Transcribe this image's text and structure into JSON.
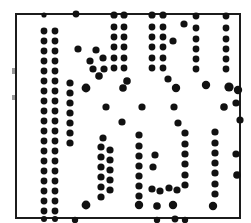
{
  "figure": {
    "kind": "dot-matrix-plate",
    "width": 251,
    "height": 223,
    "background_color": "#ffffff",
    "dot_color": "#111111",
    "frame": {
      "color": "#1c1c1c",
      "thickness": 2,
      "x": 15,
      "y": 13,
      "width": 226,
      "height": 206
    },
    "grid": {
      "origin_x": 42,
      "origin_y": 22,
      "step_x": 10.1,
      "step_y": 10.3,
      "columns": 20,
      "rows": 19
    },
    "dot_radius_small": 3.1,
    "dot_radius_large": 4.4
  },
  "chart_data": {
    "type": "scatter",
    "xlabel": "",
    "ylabel": "",
    "xlim": [
      15,
      241
    ],
    "ylim": [
      13,
      219
    ],
    "grid": false,
    "legend": "none",
    "note": "Monochrome printed dot plate; each point is an ink dot. r = dot radius in px.",
    "points": [
      {
        "x": 44,
        "y": 15,
        "r": 2.6
      },
      {
        "x": 76,
        "y": 14,
        "r": 3.4
      },
      {
        "x": 114,
        "y": 15,
        "r": 3.6
      },
      {
        "x": 124,
        "y": 15,
        "r": 3.6
      },
      {
        "x": 152,
        "y": 15,
        "r": 3.6
      },
      {
        "x": 163,
        "y": 15,
        "r": 3.6
      },
      {
        "x": 196,
        "y": 16,
        "r": 3.4
      },
      {
        "x": 226,
        "y": 16,
        "r": 3.4
      },
      {
        "x": 44,
        "y": 31,
        "r": 3.4
      },
      {
        "x": 55,
        "y": 31,
        "r": 3.4
      },
      {
        "x": 114,
        "y": 27,
        "r": 3.4
      },
      {
        "x": 124,
        "y": 27,
        "r": 3.4
      },
      {
        "x": 152,
        "y": 27,
        "r": 3.4
      },
      {
        "x": 163,
        "y": 27,
        "r": 3.4
      },
      {
        "x": 184,
        "y": 24,
        "r": 3.6
      },
      {
        "x": 196,
        "y": 28,
        "r": 3.4
      },
      {
        "x": 226,
        "y": 28,
        "r": 3.4
      },
      {
        "x": 44,
        "y": 41,
        "r": 3.4
      },
      {
        "x": 55,
        "y": 41,
        "r": 3.4
      },
      {
        "x": 114,
        "y": 37,
        "r": 3.4
      },
      {
        "x": 124,
        "y": 37,
        "r": 3.4
      },
      {
        "x": 152,
        "y": 37,
        "r": 3.4
      },
      {
        "x": 163,
        "y": 37,
        "r": 3.4
      },
      {
        "x": 173,
        "y": 41,
        "r": 3.6
      },
      {
        "x": 196,
        "y": 39,
        "r": 3.4
      },
      {
        "x": 226,
        "y": 39,
        "r": 3.4
      },
      {
        "x": 44,
        "y": 51,
        "r": 3.4
      },
      {
        "x": 55,
        "y": 51,
        "r": 3.4
      },
      {
        "x": 78,
        "y": 49,
        "r": 3.6
      },
      {
        "x": 96,
        "y": 50,
        "r": 3.6
      },
      {
        "x": 114,
        "y": 47,
        "r": 3.4
      },
      {
        "x": 124,
        "y": 47,
        "r": 3.4
      },
      {
        "x": 152,
        "y": 47,
        "r": 3.4
      },
      {
        "x": 163,
        "y": 47,
        "r": 3.4
      },
      {
        "x": 196,
        "y": 49,
        "r": 3.4
      },
      {
        "x": 226,
        "y": 49,
        "r": 3.4
      },
      {
        "x": 44,
        "y": 61,
        "r": 3.4
      },
      {
        "x": 55,
        "y": 61,
        "r": 3.4
      },
      {
        "x": 90,
        "y": 61,
        "r": 3.6
      },
      {
        "x": 103,
        "y": 58,
        "r": 3.6
      },
      {
        "x": 114,
        "y": 58,
        "r": 3.4
      },
      {
        "x": 124,
        "y": 58,
        "r": 3.4
      },
      {
        "x": 152,
        "y": 58,
        "r": 3.4
      },
      {
        "x": 163,
        "y": 58,
        "r": 3.4
      },
      {
        "x": 196,
        "y": 59,
        "r": 3.4
      },
      {
        "x": 226,
        "y": 59,
        "r": 3.4
      },
      {
        "x": 44,
        "y": 71,
        "r": 3.4
      },
      {
        "x": 55,
        "y": 71,
        "r": 3.4
      },
      {
        "x": 93,
        "y": 69,
        "r": 3.6
      },
      {
        "x": 104,
        "y": 69,
        "r": 3.6
      },
      {
        "x": 114,
        "y": 68,
        "r": 3.4
      },
      {
        "x": 124,
        "y": 68,
        "r": 3.4
      },
      {
        "x": 152,
        "y": 68,
        "r": 3.4
      },
      {
        "x": 163,
        "y": 68,
        "r": 3.4
      },
      {
        "x": 196,
        "y": 69,
        "r": 3.4
      },
      {
        "x": 226,
        "y": 69,
        "r": 3.4
      },
      {
        "x": 44,
        "y": 81,
        "r": 3.4
      },
      {
        "x": 55,
        "y": 81,
        "r": 3.4
      },
      {
        "x": 70,
        "y": 83,
        "r": 3.6
      },
      {
        "x": 99,
        "y": 76,
        "r": 3.8
      },
      {
        "x": 127,
        "y": 81,
        "r": 3.8
      },
      {
        "x": 168,
        "y": 79,
        "r": 3.6
      },
      {
        "x": 44,
        "y": 91,
        "r": 3.4
      },
      {
        "x": 55,
        "y": 91,
        "r": 3.4
      },
      {
        "x": 70,
        "y": 93,
        "r": 3.6
      },
      {
        "x": 86,
        "y": 88,
        "r": 4.4
      },
      {
        "x": 123,
        "y": 88,
        "r": 3.8
      },
      {
        "x": 176,
        "y": 88,
        "r": 4.2
      },
      {
        "x": 206,
        "y": 85,
        "r": 4.2
      },
      {
        "x": 229,
        "y": 87,
        "r": 4.6
      },
      {
        "x": 238,
        "y": 90,
        "r": 4.2
      },
      {
        "x": 44,
        "y": 101,
        "r": 3.4
      },
      {
        "x": 55,
        "y": 101,
        "r": 3.4
      },
      {
        "x": 70,
        "y": 103,
        "r": 3.6
      },
      {
        "x": 236,
        "y": 103,
        "r": 3.6
      },
      {
        "x": 44,
        "y": 111,
        "r": 3.4
      },
      {
        "x": 55,
        "y": 111,
        "r": 3.4
      },
      {
        "x": 70,
        "y": 113,
        "r": 3.6
      },
      {
        "x": 106,
        "y": 107,
        "r": 3.6
      },
      {
        "x": 142,
        "y": 107,
        "r": 3.6
      },
      {
        "x": 174,
        "y": 107,
        "r": 3.6
      },
      {
        "x": 224,
        "y": 107,
        "r": 3.8
      },
      {
        "x": 44,
        "y": 121,
        "r": 3.4
      },
      {
        "x": 55,
        "y": 121,
        "r": 3.4
      },
      {
        "x": 70,
        "y": 123,
        "r": 3.6
      },
      {
        "x": 122,
        "y": 122,
        "r": 3.6
      },
      {
        "x": 178,
        "y": 123,
        "r": 3.6
      },
      {
        "x": 240,
        "y": 120,
        "r": 3.6
      },
      {
        "x": 44,
        "y": 131,
        "r": 3.4
      },
      {
        "x": 55,
        "y": 131,
        "r": 3.4
      },
      {
        "x": 70,
        "y": 133,
        "r": 3.6
      },
      {
        "x": 44,
        "y": 141,
        "r": 3.4
      },
      {
        "x": 55,
        "y": 141,
        "r": 3.4
      },
      {
        "x": 70,
        "y": 143,
        "r": 3.6
      },
      {
        "x": 103,
        "y": 138,
        "r": 3.6
      },
      {
        "x": 139,
        "y": 135,
        "r": 3.6
      },
      {
        "x": 185,
        "y": 133,
        "r": 3.6
      },
      {
        "x": 215,
        "y": 132,
        "r": 3.6
      },
      {
        "x": 44,
        "y": 151,
        "r": 3.4
      },
      {
        "x": 55,
        "y": 151,
        "r": 3.4
      },
      {
        "x": 101,
        "y": 147,
        "r": 3.6
      },
      {
        "x": 110,
        "y": 150,
        "r": 3.6
      },
      {
        "x": 139,
        "y": 146,
        "r": 3.6
      },
      {
        "x": 185,
        "y": 144,
        "r": 3.6
      },
      {
        "x": 215,
        "y": 143,
        "r": 3.6
      },
      {
        "x": 44,
        "y": 161,
        "r": 3.4
      },
      {
        "x": 55,
        "y": 161,
        "r": 3.4
      },
      {
        "x": 101,
        "y": 157,
        "r": 3.6
      },
      {
        "x": 110,
        "y": 160,
        "r": 3.6
      },
      {
        "x": 139,
        "y": 156,
        "r": 3.6
      },
      {
        "x": 155,
        "y": 155,
        "r": 3.6
      },
      {
        "x": 185,
        "y": 154,
        "r": 3.6
      },
      {
        "x": 215,
        "y": 153,
        "r": 3.6
      },
      {
        "x": 236,
        "y": 154,
        "r": 3.6
      },
      {
        "x": 44,
        "y": 171,
        "r": 3.4
      },
      {
        "x": 55,
        "y": 171,
        "r": 3.4
      },
      {
        "x": 101,
        "y": 167,
        "r": 3.6
      },
      {
        "x": 110,
        "y": 170,
        "r": 3.6
      },
      {
        "x": 139,
        "y": 166,
        "r": 3.6
      },
      {
        "x": 153,
        "y": 167,
        "r": 3.6
      },
      {
        "x": 185,
        "y": 164,
        "r": 3.6
      },
      {
        "x": 215,
        "y": 163,
        "r": 3.6
      },
      {
        "x": 44,
        "y": 181,
        "r": 3.4
      },
      {
        "x": 55,
        "y": 181,
        "r": 3.4
      },
      {
        "x": 101,
        "y": 177,
        "r": 3.6
      },
      {
        "x": 110,
        "y": 180,
        "r": 3.6
      },
      {
        "x": 139,
        "y": 176,
        "r": 3.6
      },
      {
        "x": 185,
        "y": 175,
        "r": 3.6
      },
      {
        "x": 215,
        "y": 173,
        "r": 3.6
      },
      {
        "x": 237,
        "y": 175,
        "r": 3.8
      },
      {
        "x": 44,
        "y": 191,
        "r": 3.4
      },
      {
        "x": 55,
        "y": 191,
        "r": 3.4
      },
      {
        "x": 101,
        "y": 187,
        "r": 3.6
      },
      {
        "x": 110,
        "y": 190,
        "r": 3.6
      },
      {
        "x": 139,
        "y": 186,
        "r": 3.6
      },
      {
        "x": 152,
        "y": 189,
        "r": 3.6
      },
      {
        "x": 160,
        "y": 191,
        "r": 3.6
      },
      {
        "x": 169,
        "y": 188,
        "r": 3.6
      },
      {
        "x": 177,
        "y": 190,
        "r": 3.6
      },
      {
        "x": 185,
        "y": 185,
        "r": 3.6
      },
      {
        "x": 215,
        "y": 184,
        "r": 3.6
      },
      {
        "x": 44,
        "y": 201,
        "r": 3.4
      },
      {
        "x": 55,
        "y": 201,
        "r": 3.4
      },
      {
        "x": 101,
        "y": 197,
        "r": 3.6
      },
      {
        "x": 139,
        "y": 196,
        "r": 3.6
      },
      {
        "x": 215,
        "y": 194,
        "r": 3.6
      },
      {
        "x": 44,
        "y": 211,
        "r": 3.4
      },
      {
        "x": 55,
        "y": 211,
        "r": 3.4
      },
      {
        "x": 86,
        "y": 205,
        "r": 4.4
      },
      {
        "x": 139,
        "y": 205,
        "r": 4.2
      },
      {
        "x": 157,
        "y": 206,
        "r": 3.8
      },
      {
        "x": 173,
        "y": 205,
        "r": 4.2
      },
      {
        "x": 213,
        "y": 206,
        "r": 4.2
      },
      {
        "x": 44,
        "y": 219,
        "r": 3.0
      },
      {
        "x": 55,
        "y": 219,
        "r": 3.0
      },
      {
        "x": 75,
        "y": 220,
        "r": 3.2
      },
      {
        "x": 157,
        "y": 220,
        "r": 3.2
      },
      {
        "x": 175,
        "y": 219,
        "r": 3.4
      },
      {
        "x": 185,
        "y": 220,
        "r": 3.2
      }
    ]
  }
}
